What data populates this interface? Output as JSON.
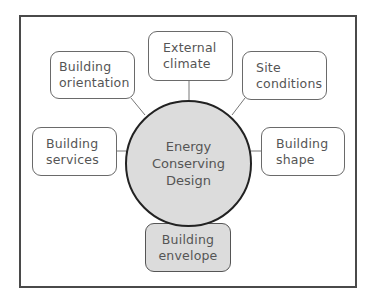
{
  "diagram": {
    "type": "hub-and-spoke",
    "center": {
      "lines": [
        "Energy",
        "Conserving",
        "Design"
      ],
      "fill": "#dcdcdc"
    },
    "nodes": [
      {
        "id": "external-climate",
        "lines": [
          "External",
          "climate"
        ],
        "position": "top",
        "highlighted": false
      },
      {
        "id": "building-orientation",
        "lines": [
          "Building",
          "orientation"
        ],
        "position": "top-left",
        "highlighted": false
      },
      {
        "id": "site-conditions",
        "lines": [
          "Site",
          "conditions"
        ],
        "position": "top-right",
        "highlighted": false
      },
      {
        "id": "building-services",
        "lines": [
          "Building",
          "services"
        ],
        "position": "left",
        "highlighted": false
      },
      {
        "id": "building-shape",
        "lines": [
          "Building",
          "shape"
        ],
        "position": "right",
        "highlighted": false
      },
      {
        "id": "building-envelope",
        "lines": [
          "Building",
          "envelope"
        ],
        "position": "bottom",
        "highlighted": true
      }
    ],
    "colors": {
      "frame": "#4a4a4a",
      "node_border": "#6a6a6a",
      "highlight_fill": "#dcdcdc",
      "text": "#555555",
      "hub_border": "#222222"
    }
  }
}
